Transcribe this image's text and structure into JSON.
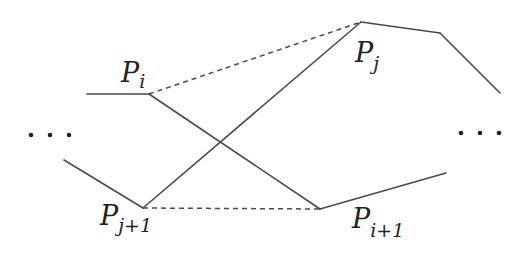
{
  "diagram": {
    "colors": {
      "line": "#4a4a4a",
      "text": "#222222",
      "background": "#ffffff"
    },
    "labels": {
      "p_i": {
        "base": "P",
        "sub": "i"
      },
      "p_j": {
        "base": "P",
        "sub": "j"
      },
      "p_j1": {
        "base": "P",
        "sub": "j+1"
      },
      "p_i1": {
        "base": "P",
        "sub": "i+1"
      }
    },
    "ellipsis_left": "...",
    "ellipsis_right": "...",
    "vertices": {
      "P_i": [
        149,
        94
      ],
      "P_j": [
        361,
        22
      ],
      "P_j+1": [
        143,
        208
      ],
      "P_i+1": [
        320,
        209
      ]
    },
    "solid_edges": [
      {
        "from": [
          87,
          94
        ],
        "to": [
          149,
          94
        ]
      },
      {
        "from": [
          149,
          94
        ],
        "to": [
          320,
          209
        ]
      },
      {
        "from": [
          320,
          209
        ],
        "to": [
          446,
          173
        ]
      },
      {
        "from": [
          64,
          160
        ],
        "to": [
          143,
          208
        ]
      },
      {
        "from": [
          143,
          208
        ],
        "to": [
          361,
          22
        ]
      },
      {
        "from": [
          361,
          22
        ],
        "to": [
          440,
          33
        ]
      },
      {
        "from": [
          440,
          33
        ],
        "to": [
          500,
          93
        ]
      }
    ],
    "dashed_edges": [
      {
        "from": [
          149,
          94
        ],
        "to": [
          361,
          22
        ]
      },
      {
        "from": [
          143,
          208
        ],
        "to": [
          320,
          209
        ]
      }
    ]
  }
}
